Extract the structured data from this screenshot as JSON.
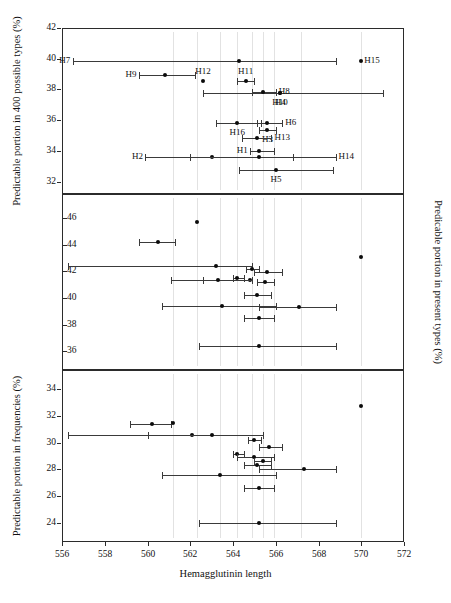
{
  "chart_data": {
    "type": "scatter",
    "title": "",
    "xlabel": "Hemagglutinin length",
    "xlim": [
      556,
      572
    ],
    "xticks": [
      556,
      558,
      560,
      562,
      564,
      566,
      568,
      570,
      572
    ],
    "grid": false,
    "legend": "none",
    "panels": [
      {
        "id": "top",
        "ylabel": "Predictable portion in 400 possible types (%)",
        "ylabel_side": "left",
        "ylim": [
          31.2,
          42
        ],
        "yticks": [
          42,
          40,
          38,
          36,
          34,
          32
        ],
        "points": [
          {
            "label": "H7",
            "label_pos": "left",
            "x": 564.3,
            "y": 39.85,
            "xlo": 556.5,
            "xhi": 568.8
          },
          {
            "label": "H9",
            "label_pos": "left",
            "x": 560.8,
            "y": 38.92,
            "xlo": 559.6,
            "xhi": 562.2
          },
          {
            "label": "H12",
            "label_pos": "above",
            "x": 562.6,
            "y": 38.55,
            "xlo": 562.6,
            "xhi": 562.6
          },
          {
            "label": "H11",
            "label_pos": "above",
            "x": 564.6,
            "y": 38.58,
            "xlo": 564.2,
            "xhi": 565.0
          },
          {
            "label": "H15",
            "label_pos": "right",
            "x": 570.0,
            "y": 39.85,
            "xlo": 570.0,
            "xhi": 570.0
          },
          {
            "label": "H10",
            "label_pos": "below",
            "x": 566.2,
            "y": 37.78,
            "xlo": 562.6,
            "xhi": 571.0
          },
          {
            "label": "H4",
            "label_pos": "below",
            "x": 566.2,
            "y": 37.78,
            "xlo": 562.6,
            "xhi": 571.0
          },
          {
            "label": "H8",
            "label_pos": "right",
            "x": 565.4,
            "y": 37.85,
            "xlo": 564.9,
            "xhi": 566.0
          },
          {
            "label": "H16",
            "label_pos": "below",
            "x": 564.2,
            "y": 35.85,
            "xlo": 563.2,
            "xhi": 565.3
          },
          {
            "label": "H6",
            "label_pos": "right",
            "x": 565.6,
            "y": 35.85,
            "xlo": 565.1,
            "xhi": 566.3
          },
          {
            "label": "H3",
            "label_pos": "below",
            "x": 565.6,
            "y": 35.35,
            "xlo": 565.2,
            "xhi": 566.0
          },
          {
            "label": "H13",
            "label_pos": "right",
            "x": 565.1,
            "y": 34.82,
            "xlo": 564.4,
            "xhi": 565.8
          },
          {
            "label": "H2",
            "label_pos": "left",
            "x": 563.0,
            "y": 33.62,
            "xlo": 559.9,
            "xhi": 566.8
          },
          {
            "label": "H1",
            "label_pos": "left",
            "x": 565.2,
            "y": 33.98,
            "xlo": 564.8,
            "xhi": 565.9
          },
          {
            "label": "H14",
            "label_pos": "right",
            "x": 565.2,
            "y": 33.62,
            "xlo": 562.0,
            "xhi": 568.8
          },
          {
            "label": "H5",
            "label_pos": "below",
            "x": 566.0,
            "y": 32.75,
            "xlo": 564.3,
            "xhi": 568.7
          }
        ]
      },
      {
        "id": "middle",
        "ylabel": "Predicable portion in present types (%)",
        "ylabel_side": "right",
        "ylim": [
          34.6,
          47.8
        ],
        "yticks": [
          46,
          44,
          42,
          40,
          38,
          36
        ],
        "points": [
          {
            "label": "",
            "x": 562.3,
            "y": 45.7,
            "xlo": 562.3,
            "xhi": 562.3
          },
          {
            "label": "",
            "x": 560.5,
            "y": 44.2,
            "xlo": 559.6,
            "xhi": 561.3
          },
          {
            "label": "",
            "x": 563.2,
            "y": 42.4,
            "xlo": 556.3,
            "xhi": 564.9
          },
          {
            "label": "",
            "x": 570.0,
            "y": 43.1,
            "xlo": 570.0,
            "xhi": 570.0
          },
          {
            "label": "",
            "x": 564.9,
            "y": 42.2,
            "xlo": 564.6,
            "xhi": 565.2
          },
          {
            "label": "",
            "x": 565.6,
            "y": 41.95,
            "xlo": 565.0,
            "xhi": 566.3
          },
          {
            "label": "",
            "x": 564.2,
            "y": 41.5,
            "xlo": 564.0,
            "xhi": 564.5
          },
          {
            "label": "",
            "x": 564.8,
            "y": 41.35,
            "xlo": 562.6,
            "xhi": 564.9
          },
          {
            "label": "",
            "x": 563.3,
            "y": 41.35,
            "xlo": 561.1,
            "xhi": 564.9
          },
          {
            "label": "",
            "x": 565.5,
            "y": 41.2,
            "xlo": 565.1,
            "xhi": 565.9
          },
          {
            "label": "",
            "x": 565.1,
            "y": 40.2,
            "xlo": 564.5,
            "xhi": 565.8
          },
          {
            "label": "",
            "x": 563.5,
            "y": 39.4,
            "xlo": 560.7,
            "xhi": 566.0
          },
          {
            "label": "",
            "x": 567.1,
            "y": 39.3,
            "xlo": 565.2,
            "xhi": 568.8
          },
          {
            "label": "",
            "x": 565.2,
            "y": 38.5,
            "xlo": 564.5,
            "xhi": 565.9
          },
          {
            "label": "",
            "x": 565.2,
            "y": 36.4,
            "xlo": 562.4,
            "xhi": 568.8
          }
        ]
      },
      {
        "id": "bottom",
        "ylabel": "Predictable portion in frequencies (%)",
        "ylabel_side": "left",
        "ylim": [
          22.6,
          35.4
        ],
        "yticks": [
          34,
          32,
          30,
          28,
          26,
          24
        ],
        "points": [
          {
            "label": "",
            "x": 570.0,
            "y": 32.75,
            "xlo": 570.0,
            "xhi": 570.0
          },
          {
            "label": "",
            "x": 560.2,
            "y": 31.35,
            "xlo": 559.2,
            "xhi": 561.1
          },
          {
            "label": "",
            "x": 561.2,
            "y": 31.45,
            "xlo": 561.2,
            "xhi": 561.2
          },
          {
            "label": "",
            "x": 562.1,
            "y": 30.6,
            "xlo": 556.3,
            "xhi": 565.4
          },
          {
            "label": "",
            "x": 563.0,
            "y": 30.6,
            "xlo": 560.0,
            "xhi": 565.4
          },
          {
            "label": "",
            "x": 565.0,
            "y": 30.2,
            "xlo": 564.7,
            "xhi": 565.3
          },
          {
            "label": "",
            "x": 565.7,
            "y": 29.65,
            "xlo": 565.2,
            "xhi": 566.3
          },
          {
            "label": "",
            "x": 564.2,
            "y": 29.15,
            "xlo": 564.0,
            "xhi": 564.5
          },
          {
            "label": "",
            "x": 565.0,
            "y": 28.9,
            "xlo": 564.2,
            "xhi": 565.9
          },
          {
            "label": "",
            "x": 565.4,
            "y": 28.6,
            "xlo": 565.0,
            "xhi": 565.8
          },
          {
            "label": "",
            "x": 567.3,
            "y": 28.0,
            "xlo": 565.2,
            "xhi": 568.8
          },
          {
            "label": "",
            "x": 565.1,
            "y": 28.3,
            "xlo": 564.5,
            "xhi": 565.8
          },
          {
            "label": "",
            "x": 563.4,
            "y": 27.6,
            "xlo": 560.7,
            "xhi": 566.0
          },
          {
            "label": "",
            "x": 565.2,
            "y": 26.6,
            "xlo": 564.5,
            "xhi": 565.9
          },
          {
            "label": "",
            "x": 565.2,
            "y": 24.0,
            "xlo": 562.4,
            "xhi": 568.8
          }
        ]
      }
    ]
  },
  "colors": {
    "axis": "#2b2b2b",
    "marker": "#0b0b0b",
    "errorbar": "#3a3a3a",
    "guide": "#e2e2e2",
    "background": "#ffffff"
  }
}
